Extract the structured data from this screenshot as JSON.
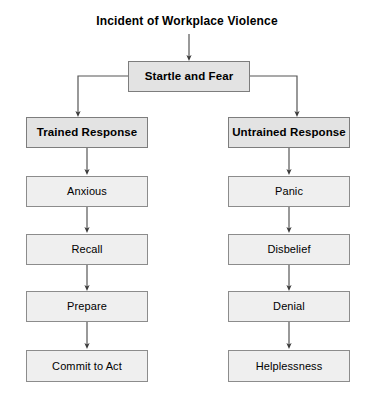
{
  "diagram": {
    "title": "Incident of Workplace Violence",
    "type": "flowchart",
    "background_color": "#ffffff",
    "box_fill_color": "#ececec",
    "box_border_color": "#8c8c8c",
    "connector_color": "#555555",
    "root": {
      "label": "Startle and Fear"
    },
    "branches": [
      {
        "header": "Trained Response",
        "steps": [
          "Anxious",
          "Recall",
          "Prepare",
          "Commit to Act"
        ]
      },
      {
        "header": "Untrained Response",
        "steps": [
          "Panic",
          "Disbelief",
          "Denial",
          "Helplessness"
        ]
      }
    ]
  }
}
